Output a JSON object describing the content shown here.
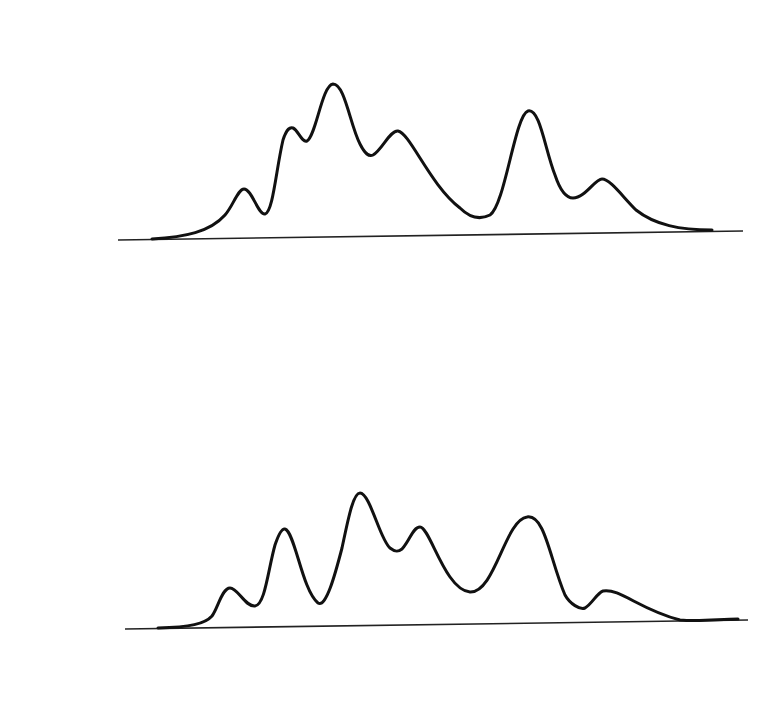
{
  "diagram": {
    "colors": {
      "ink": "#111111",
      "weighted_particle": "#888888",
      "background": "#ffffff"
    },
    "rows": [
      {
        "id": "measurement_k",
        "label": "Measurement ",
        "var": "k",
        "suffix": ""
      },
      {
        "id": "selection_k",
        "label": "Selection ",
        "var": "k",
        "suffix": ""
      },
      {
        "id": "resampling_k",
        "label": "Resampling ",
        "var": "k",
        "suffix": ""
      },
      {
        "id": "prediction_k",
        "label": "Prediction ",
        "var": "k",
        "suffix": ""
      },
      {
        "id": "measurement_k1",
        "label": "Measurement ",
        "var": "k",
        "suffix": " + 1"
      }
    ],
    "top_particles_x": [
      183,
      212,
      273,
      300,
      347,
      374,
      406,
      477,
      511,
      535,
      584,
      649
    ],
    "selection_k": [
      {
        "x": 277,
        "r": 7
      },
      {
        "x": 304,
        "r": 10
      },
      {
        "x": 351,
        "r": 12
      },
      {
        "x": 378,
        "r": 9
      },
      {
        "x": 410,
        "r": 10
      },
      {
        "x": 515,
        "r": 11
      },
      {
        "x": 539,
        "r": 12
      },
      {
        "x": 588,
        "r": 6
      }
    ],
    "resampling_k": [
      {
        "x": 278,
        "count": 1
      },
      {
        "x": 305,
        "count": 2
      },
      {
        "x": 352,
        "count": 3
      },
      {
        "x": 379,
        "count": 1
      },
      {
        "x": 411,
        "count": 1
      },
      {
        "x": 516,
        "count": 1
      },
      {
        "x": 540,
        "count": 2
      },
      {
        "x": 589,
        "count": 1
      }
    ],
    "prediction_k_x": [
      280,
      299,
      316,
      342,
      353,
      365,
      385,
      423,
      509,
      533,
      552,
      591
    ],
    "measurement_k1_weights": [
      {
        "x": 283,
        "r": 10
      },
      {
        "x": 302,
        "r": 7
      },
      {
        "x": 345,
        "r": 10
      },
      {
        "x": 356,
        "r": 12
      },
      {
        "x": 368,
        "r": 12
      },
      {
        "x": 388,
        "r": 8
      },
      {
        "x": 426,
        "r": 10
      },
      {
        "x": 512,
        "r": 10
      },
      {
        "x": 537,
        "r": 10
      },
      {
        "x": 555,
        "r": 7
      }
    ]
  }
}
